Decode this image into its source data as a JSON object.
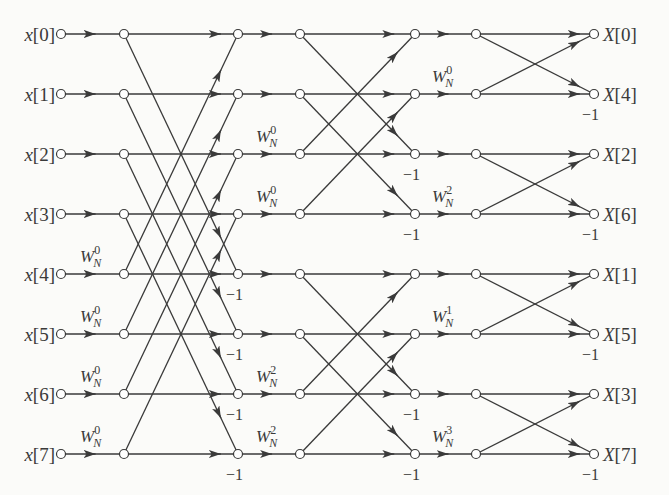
{
  "colors": {
    "background": "#fbfbf9",
    "line": "#3a3a3a",
    "node_fill": "#ffffff"
  },
  "layout": {
    "rows_y": [
      34,
      94,
      154,
      214,
      274,
      334,
      394,
      454
    ],
    "cols_x": [
      61,
      124,
      238,
      300,
      415,
      476,
      594
    ],
    "node_radius": 4.5
  },
  "inputs": [
    "x[0]",
    "x[1]",
    "x[2]",
    "x[3]",
    "x[4]",
    "x[5]",
    "x[6]",
    "x[7]"
  ],
  "outputs": [
    "X[0]",
    "X[4]",
    "X[2]",
    "X[6]",
    "X[1]",
    "X[5]",
    "X[3]",
    "X[7]"
  ],
  "stages": [
    {
      "name": "stage-1",
      "from_col": 1,
      "to_col": 2,
      "butterflies": [
        [
          0,
          4
        ],
        [
          1,
          5
        ],
        [
          2,
          6
        ],
        [
          3,
          7
        ]
      ],
      "twiddles": [
        {
          "row": 4,
          "label": "W",
          "sub": "N",
          "sup": "0"
        },
        {
          "row": 5,
          "label": "W",
          "sub": "N",
          "sup": "0"
        },
        {
          "row": 6,
          "label": "W",
          "sub": "N",
          "sup": "0"
        },
        {
          "row": 7,
          "label": "W",
          "sub": "N",
          "sup": "0"
        }
      ],
      "minus_one_rows": [
        4,
        5,
        6,
        7
      ]
    },
    {
      "name": "stage-2",
      "from_col": 3,
      "to_col": 4,
      "butterflies": [
        [
          0,
          2
        ],
        [
          1,
          3
        ],
        [
          4,
          6
        ],
        [
          5,
          7
        ]
      ],
      "twiddles": [
        {
          "row": 2,
          "label": "W",
          "sub": "N",
          "sup": "0"
        },
        {
          "row": 3,
          "label": "W",
          "sub": "N",
          "sup": "0"
        },
        {
          "row": 6,
          "label": "W",
          "sub": "N",
          "sup": "2"
        },
        {
          "row": 7,
          "label": "W",
          "sub": "N",
          "sup": "2"
        }
      ],
      "minus_one_rows": [
        2,
        3,
        6,
        7
      ]
    },
    {
      "name": "stage-3",
      "from_col": 5,
      "to_col": 6,
      "butterflies": [
        [
          0,
          1
        ],
        [
          2,
          3
        ],
        [
          4,
          5
        ],
        [
          6,
          7
        ]
      ],
      "twiddles": [
        {
          "row": 1,
          "label": "W",
          "sub": "N",
          "sup": "0"
        },
        {
          "row": 3,
          "label": "W",
          "sub": "N",
          "sup": "2"
        },
        {
          "row": 5,
          "label": "W",
          "sub": "N",
          "sup": "1"
        },
        {
          "row": 7,
          "label": "W",
          "sub": "N",
          "sup": "3"
        }
      ],
      "minus_one_rows": [
        1,
        3,
        5,
        7
      ]
    }
  ],
  "minus_one_label": "−1"
}
